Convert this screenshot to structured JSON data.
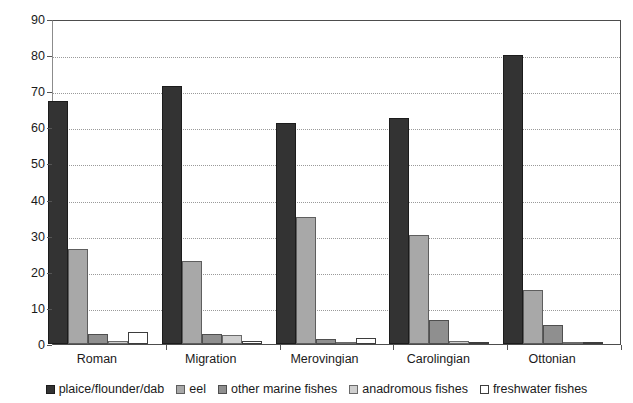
{
  "chart_data": {
    "type": "bar",
    "title": "",
    "subtitle": "",
    "xlabel": "",
    "ylabel": "",
    "categories": [
      "Roman",
      "Migration",
      "Merovingian",
      "Carolingian",
      "Ottonian"
    ],
    "series": [
      {
        "name": "plaice/flounder/dab",
        "color": "#333333",
        "values": [
          67.2,
          71.5,
          61.2,
          62.5,
          80.0
        ]
      },
      {
        "name": "eel",
        "color": "#a8a8a8",
        "values": [
          26.4,
          23.0,
          35.2,
          30.1,
          15.0
        ]
      },
      {
        "name": "other marine fishes",
        "color": "#8f8f8f",
        "values": [
          2.8,
          2.8,
          1.5,
          6.7,
          5.4
        ]
      },
      {
        "name": "anadromous fishes",
        "color": "#cfcfcf",
        "values": [
          0.8,
          2.4,
          0.4,
          0.8,
          0.3
        ]
      },
      {
        "name": "freshwater fishes",
        "color": "#ffffff",
        "values": [
          3.2,
          0.8,
          1.7,
          0.5,
          0.1
        ]
      }
    ],
    "ylim": [
      0,
      90
    ],
    "yticks": [
      0,
      10,
      20,
      30,
      40,
      50,
      60,
      70,
      80,
      90
    ],
    "ytick_labels": [
      "0",
      "10",
      "20",
      "30",
      "40",
      "50",
      "60",
      "70",
      "80",
      "90"
    ],
    "grid": true,
    "grid_axis": "y",
    "legend_position": "bottom",
    "annotations": []
  },
  "legend": {
    "items": [
      {
        "label": "plaice/flounder/dab",
        "swatch": "plaice"
      },
      {
        "label": "eel",
        "swatch": "eel"
      },
      {
        "label": "other marine fishes",
        "swatch": "othermarine"
      },
      {
        "label": "anadromous fishes",
        "swatch": "anadromous"
      },
      {
        "label": "freshwater fishes",
        "swatch": "freshwater"
      }
    ]
  }
}
